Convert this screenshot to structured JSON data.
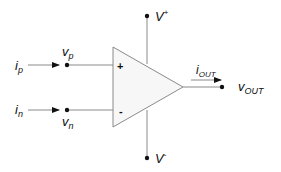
{
  "diagram": {
    "component": "op-amp",
    "colors": {
      "wire": "#8a8a8a",
      "body_fill": "#f7f7f7",
      "body_stroke": "#8a8a8a",
      "text": "#111111"
    },
    "inputs": {
      "noninverting": {
        "current_label": "i",
        "current_sub": "p",
        "voltage_label": "v",
        "voltage_sub": "p",
        "symbol": "+"
      },
      "inverting": {
        "current_label": "i",
        "current_sub": "n",
        "voltage_label": "v",
        "voltage_sub": "n",
        "symbol": "-"
      }
    },
    "supplies": {
      "positive": {
        "label": "V",
        "sup": "+"
      },
      "negative": {
        "label": "V",
        "sup": "-"
      }
    },
    "output": {
      "current_label": "i",
      "current_sub": "OUT",
      "voltage_label": "v",
      "voltage_sub": "OUT"
    }
  }
}
